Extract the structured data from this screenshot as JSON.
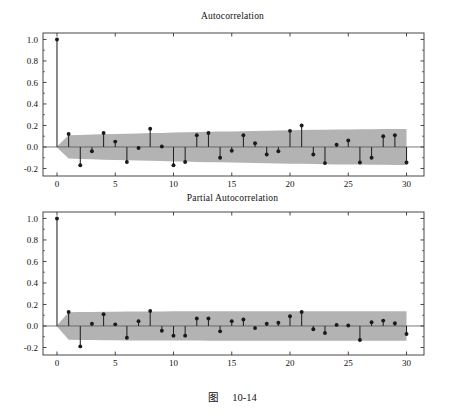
{
  "figure": {
    "caption_label": "图",
    "caption_number": "10-14",
    "background": "#ffffff"
  },
  "style": {
    "band_color": "#b3b3b3",
    "stem_color": "#222222",
    "marker_color": "#1a1a1a",
    "axis_color": "#333333",
    "zero_line_color": "#555555"
  },
  "chart_data": [
    {
      "type": "bar",
      "subtype": "stem-acf",
      "title": "Autocorrelation",
      "xlabel": "",
      "ylabel": "",
      "xlim": [
        -1.2,
        31.5
      ],
      "ylim": [
        -0.27,
        1.06
      ],
      "xticks": [
        0,
        5,
        10,
        15,
        20,
        25,
        30
      ],
      "xtick_labels": [
        "0",
        "5",
        "10",
        "15",
        "20",
        "25",
        "30"
      ],
      "yticks": [
        -0.2,
        0.0,
        0.2,
        0.4,
        0.6,
        0.8,
        1.0
      ],
      "ytick_labels": [
        "-0.2",
        "0.0",
        "0.2",
        "0.4",
        "0.6",
        "0.8",
        "1.0"
      ],
      "grid": false,
      "legend": "none",
      "zero_line": 0.0,
      "confidence_band": {
        "label": "approximate 95% confidence bounds",
        "lags": [
          0,
          1,
          2,
          3,
          4,
          5,
          6,
          7,
          8,
          9,
          10,
          11,
          12,
          13,
          14,
          15,
          16,
          17,
          18,
          19,
          20,
          21,
          22,
          23,
          24,
          25,
          26,
          27,
          28,
          29,
          30
        ],
        "upper": [
          0.005,
          0.108,
          0.112,
          0.115,
          0.118,
          0.121,
          0.124,
          0.126,
          0.129,
          0.131,
          0.134,
          0.136,
          0.139,
          0.141,
          0.143,
          0.145,
          0.147,
          0.149,
          0.151,
          0.153,
          0.155,
          0.157,
          0.159,
          0.16,
          0.162,
          0.163,
          0.164,
          0.165,
          0.166,
          0.167,
          0.168
        ],
        "lower": [
          -0.005,
          -0.108,
          -0.112,
          -0.115,
          -0.118,
          -0.121,
          -0.124,
          -0.126,
          -0.129,
          -0.131,
          -0.134,
          -0.136,
          -0.139,
          -0.141,
          -0.143,
          -0.145,
          -0.147,
          -0.149,
          -0.151,
          -0.153,
          -0.155,
          -0.157,
          -0.159,
          -0.16,
          -0.162,
          -0.163,
          -0.164,
          -0.165,
          -0.166,
          -0.167,
          -0.168
        ]
      },
      "categories": [
        0,
        1,
        2,
        3,
        4,
        5,
        6,
        7,
        8,
        9,
        10,
        11,
        12,
        13,
        14,
        15,
        16,
        17,
        18,
        19,
        20,
        21,
        22,
        23,
        24,
        25,
        26,
        27,
        28,
        29,
        30
      ],
      "values": [
        1.0,
        0.12,
        -0.17,
        -0.04,
        0.13,
        0.05,
        -0.14,
        -0.01,
        0.17,
        0.005,
        -0.17,
        -0.14,
        0.11,
        0.13,
        -0.1,
        -0.035,
        0.11,
        0.035,
        -0.07,
        -0.04,
        0.15,
        0.2,
        -0.07,
        -0.15,
        0.02,
        0.06,
        -0.145,
        -0.1,
        0.1,
        0.11,
        -0.145
      ]
    },
    {
      "type": "bar",
      "subtype": "stem-pacf",
      "title": "Partial Autocorrelation",
      "xlabel": "",
      "ylabel": "",
      "xlim": [
        -1.2,
        31.5
      ],
      "ylim": [
        -0.27,
        1.06
      ],
      "xticks": [
        0,
        5,
        10,
        15,
        20,
        25,
        30
      ],
      "xtick_labels": [
        "0",
        "5",
        "10",
        "15",
        "20",
        "25",
        "30"
      ],
      "yticks": [
        -0.2,
        0.0,
        0.2,
        0.4,
        0.6,
        0.8,
        1.0
      ],
      "ytick_labels": [
        "-0.2",
        "0.0",
        "0.2",
        "0.4",
        "0.6",
        "0.8",
        "1.0"
      ],
      "grid": false,
      "legend": "none",
      "zero_line": 0.0,
      "confidence_band": {
        "label": "approximate 95% confidence bounds",
        "lags": [
          0,
          1,
          2,
          3,
          4,
          5,
          6,
          7,
          8,
          9,
          10,
          11,
          12,
          13,
          14,
          15,
          16,
          17,
          18,
          19,
          20,
          21,
          22,
          23,
          24,
          25,
          26,
          27,
          28,
          29,
          30
        ],
        "upper": [
          0.005,
          0.128,
          0.13,
          0.131,
          0.132,
          0.133,
          0.134,
          0.134,
          0.135,
          0.135,
          0.136,
          0.136,
          0.136,
          0.137,
          0.137,
          0.137,
          0.137,
          0.137,
          0.137,
          0.137,
          0.137,
          0.137,
          0.137,
          0.137,
          0.137,
          0.137,
          0.137,
          0.137,
          0.137,
          0.137,
          0.137
        ],
        "lower": [
          -0.005,
          -0.128,
          -0.13,
          -0.131,
          -0.132,
          -0.133,
          -0.134,
          -0.134,
          -0.135,
          -0.135,
          -0.136,
          -0.136,
          -0.136,
          -0.137,
          -0.137,
          -0.137,
          -0.137,
          -0.137,
          -0.137,
          -0.137,
          -0.137,
          -0.137,
          -0.137,
          -0.137,
          -0.137,
          -0.137,
          -0.137,
          -0.137,
          -0.137,
          -0.137,
          -0.137
        ]
      },
      "categories": [
        0,
        1,
        2,
        3,
        4,
        5,
        6,
        7,
        8,
        9,
        10,
        11,
        12,
        13,
        14,
        15,
        16,
        17,
        18,
        19,
        20,
        21,
        22,
        23,
        24,
        25,
        26,
        27,
        28,
        29,
        30
      ],
      "values": [
        1.0,
        0.13,
        -0.19,
        0.02,
        0.11,
        0.015,
        -0.11,
        0.045,
        0.14,
        -0.045,
        -0.09,
        -0.09,
        0.07,
        0.07,
        -0.05,
        0.045,
        0.06,
        -0.02,
        0.02,
        0.03,
        0.09,
        0.13,
        -0.03,
        -0.065,
        0.01,
        0.005,
        -0.13,
        0.035,
        0.05,
        0.025,
        -0.075
      ]
    }
  ]
}
